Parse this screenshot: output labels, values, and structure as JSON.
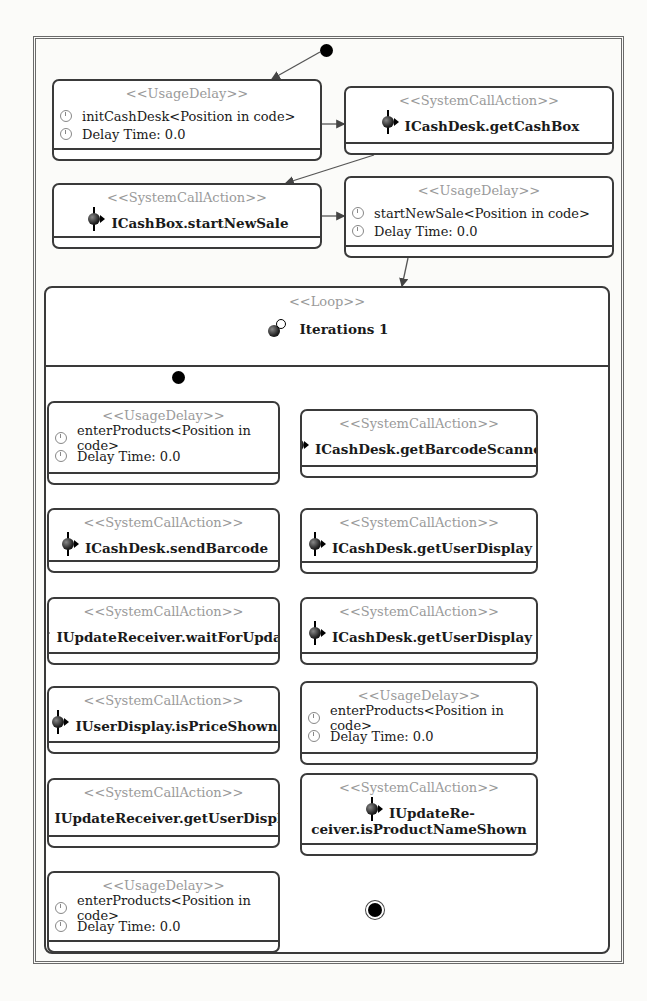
{
  "diagram": {
    "top_level": {
      "nodes": [
        {
          "id": "n1",
          "type": "UsageDelay",
          "stereotype": "<<UsageDelay>>",
          "name": "initCashDesk<Position in code>",
          "delay": "Delay Time: 0.0"
        },
        {
          "id": "n2",
          "type": "SystemCallAction",
          "stereotype": "<<SystemCallAction>>",
          "name": "ICashDesk.getCashBox"
        },
        {
          "id": "n3",
          "type": "SystemCallAction",
          "stereotype": "<<SystemCallAction>>",
          "name": "ICashBox.startNewSale"
        },
        {
          "id": "n4",
          "type": "UsageDelay",
          "stereotype": "<<UsageDelay>>",
          "name": "startNewSale<Position in code>",
          "delay": "Delay Time: 0.0"
        }
      ]
    },
    "loop": {
      "stereotype": "<<Loop>>",
      "iterations": "Iterations 1",
      "nodes": [
        {
          "id": "l1",
          "type": "UsageDelay",
          "stereotype": "<<UsageDelay>>",
          "name": "enterProducts<Position in code>",
          "delay": "Delay Time: 0.0"
        },
        {
          "id": "l2",
          "type": "SystemCallAction",
          "stereotype": "<<SystemCallAction>>",
          "name": "ICashDesk.getBarcodeScanner"
        },
        {
          "id": "l3",
          "type": "SystemCallAction",
          "stereotype": "<<SystemCallAction>>",
          "name": "ICashDesk.sendBarcode"
        },
        {
          "id": "l4",
          "type": "SystemCallAction",
          "stereotype": "<<SystemCallAction>>",
          "name": "ICashDesk.getUserDisplay"
        },
        {
          "id": "l5",
          "type": "SystemCallAction",
          "stereotype": "<<SystemCallAction>>",
          "name": "IUpdateReceiver.waitForUpdate"
        },
        {
          "id": "l6",
          "type": "SystemCallAction",
          "stereotype": "<<SystemCallAction>>",
          "name": "ICashDesk.getUserDisplay"
        },
        {
          "id": "l7",
          "type": "SystemCallAction",
          "stereotype": "<<SystemCallAction>>",
          "name": "IUserDisplay.isPriceShown"
        },
        {
          "id": "l8",
          "type": "UsageDelay",
          "stereotype": "<<UsageDelay>>",
          "name": "enterProducts<Position in code>",
          "delay": "Delay Time: 0.0"
        },
        {
          "id": "l9",
          "type": "SystemCallAction",
          "stereotype": "<<SystemCallAction>>",
          "name": "IUpdateReceiver.getUserDisplay"
        },
        {
          "id": "l10",
          "type": "SystemCallAction",
          "stereotype": "<<SystemCallAction>>",
          "name_line1": "IUpdateRe-",
          "name_line2": "ceiver.isProductNameShown"
        },
        {
          "id": "l11",
          "type": "UsageDelay",
          "stereotype": "<<UsageDelay>>",
          "name": "enterProducts<Position in code>",
          "delay": "Delay Time: 0.0"
        }
      ]
    },
    "edges": [
      [
        "start",
        "n1"
      ],
      [
        "n1",
        "n2"
      ],
      [
        "n2",
        "n3"
      ],
      [
        "n3",
        "n4"
      ],
      [
        "n4",
        "loop"
      ],
      [
        "loop_start",
        "l1"
      ],
      [
        "l1",
        "l2"
      ],
      [
        "l2",
        "l3"
      ],
      [
        "l3",
        "l4"
      ],
      [
        "l4",
        "l5"
      ],
      [
        "l5",
        "l6"
      ],
      [
        "l6",
        "l7"
      ],
      [
        "l7",
        "l8"
      ],
      [
        "l8",
        "l9"
      ],
      [
        "l9",
        "l10"
      ],
      [
        "l10",
        "l11"
      ],
      [
        "l11",
        "loop_end"
      ]
    ]
  }
}
